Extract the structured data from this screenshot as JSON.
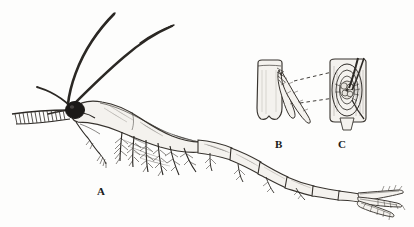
{
  "figure": {
    "background_color": "#fdfdfc",
    "ink_color": "#2b2824",
    "panels": [
      {
        "id": "A",
        "label": "A",
        "caption": "whole animal, lateral view",
        "label_x": 97,
        "label_y": 186
      },
      {
        "id": "B",
        "label": "B",
        "caption": "appendage segment with setae",
        "label_x": 275,
        "label_y": 139
      },
      {
        "id": "C",
        "label": "C",
        "caption": "magnified detail of seta attachment",
        "label_x": 338,
        "label_y": 139
      }
    ],
    "connectors": [
      {
        "name": "upper-dashed-leader",
        "from": [
          294,
          81
        ],
        "to": [
          345,
          69
        ]
      },
      {
        "name": "lower-dashed-leader",
        "from": [
          300,
          103
        ],
        "to": [
          348,
          96
        ]
      }
    ],
    "features": {
      "antennae_count": 2,
      "eye": "dark spherical compound eye",
      "abdomen_segments": 6,
      "thoracic_legs": "feathered thoracopods",
      "tail": "uropods and telson fan"
    }
  }
}
